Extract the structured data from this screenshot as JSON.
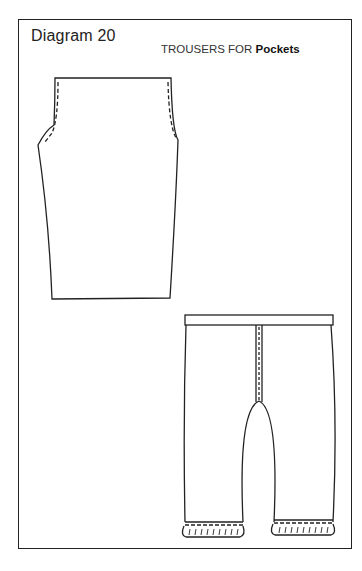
{
  "diagram": {
    "title": "Diagram 20",
    "subtitle_prefix": "TROUSERS FOR ",
    "subtitle_bold": "Pockets"
  },
  "figures": [
    {
      "name": "trouser-pattern-piece",
      "description": "flat pattern piece with dashed seam lines"
    },
    {
      "name": "assembled-trousers",
      "description": "trousers with waistband, center seam and frilled cuffs"
    }
  ],
  "colors": {
    "line": "#222222",
    "background": "#ffffff"
  }
}
